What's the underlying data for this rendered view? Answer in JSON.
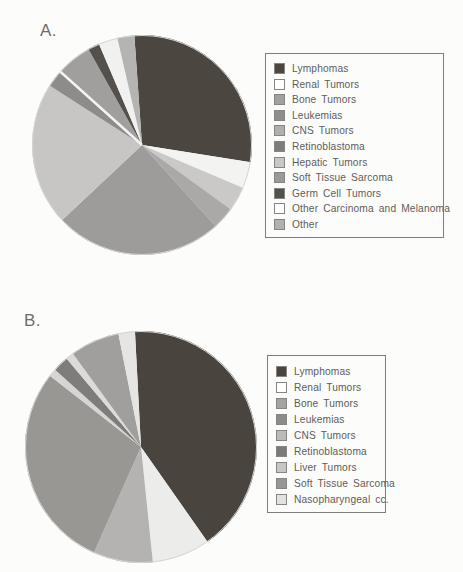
{
  "page": {
    "background_color": "#fcfcfa",
    "legend_border_color": "#7e7e7c",
    "text_color": "#5c5c5a"
  },
  "chart_data": [
    {
      "type": "pie",
      "id": "a",
      "panel_label": "A.",
      "start_angle_deg": -4,
      "legend_position": "right",
      "separators_deg": [
        311.9
      ],
      "slices": [
        {
          "label": "Lymphomas",
          "value": 28.6,
          "color": "#4c4641",
          "legend_swatch": "#4c4641"
        },
        {
          "label": "Renal Tumors",
          "value": 3.9,
          "color": "#f3f3f1",
          "legend_swatch": "#ffffff"
        },
        {
          "label": "Bone Tumors",
          "value": 3.6,
          "color": "#cac9c7",
          "legend_swatch": "#a2a19f"
        },
        {
          "label": "Leukemias",
          "value": 3.3,
          "color": "#aaa9a7",
          "legend_swatch": "#8f8e8c"
        },
        {
          "label": "CNS Tumors",
          "value": 24.7,
          "color": "#9d9c9a",
          "legend_swatch": "#b0afad"
        },
        {
          "label": "Retinoblastoma",
          "value": 21.1,
          "color": "#c7c6c4",
          "legend_swatch": "#7e7d7b"
        },
        {
          "label": "Hepatic Tumors",
          "value": 2.5,
          "color": "#8d8c8a",
          "legend_swatch": "#c9c8c6"
        },
        {
          "label": "Soft Tissue Sarcoma",
          "value": 5.3,
          "color": "#a09f9d",
          "legend_swatch": "#9b9a98"
        },
        {
          "label": "Germ Cell Tumors",
          "value": 1.7,
          "color": "#54504b",
          "legend_swatch": "#54504b"
        },
        {
          "label": "Other Carcinoma and Melanoma",
          "value": 2.8,
          "color": "#f1f1ef",
          "legend_swatch": "#ffffff"
        },
        {
          "label": "Other",
          "value": 2.5,
          "color": "#b5b4b2",
          "legend_swatch": "#b2b1af"
        }
      ]
    },
    {
      "type": "pie",
      "id": "b",
      "panel_label": "B.",
      "start_angle_deg": -3,
      "legend_position": "right",
      "separators_deg": [],
      "slices": [
        {
          "label": "Lymphomas",
          "value": 41.1,
          "color": "#49443e",
          "legend_swatch": "#49443e"
        },
        {
          "label": "Renal Tumors",
          "value": 8.1,
          "color": "#ececea",
          "legend_swatch": "#ffffff"
        },
        {
          "label": "Bone Tumors",
          "value": 8.3,
          "color": "#b4b3b1",
          "legend_swatch": "#a5a4a2"
        },
        {
          "label": "Leukemias",
          "value": 28.9,
          "color": "#989794",
          "legend_swatch": "#8d8c8a"
        },
        {
          "label": "CNS Tumors",
          "value": 1.1,
          "color": "#d6d5d3",
          "legend_swatch": "#bcbbb9"
        },
        {
          "label": "Retinoblastoma",
          "value": 2.2,
          "color": "#7e7d7b",
          "legend_swatch": "#7b7a78"
        },
        {
          "label": "Liver Tumors",
          "value": 1.1,
          "color": "#dcdbd9",
          "legend_swatch": "#c8c7c5"
        },
        {
          "label": "Soft Tissue Sarcoma",
          "value": 6.9,
          "color": "#a09f9d",
          "legend_swatch": "#989795"
        },
        {
          "label": "Nasopharyngeal cc.",
          "value": 2.3,
          "color": "#e6e5e3",
          "legend_swatch": "#e3e2e0"
        }
      ]
    }
  ]
}
